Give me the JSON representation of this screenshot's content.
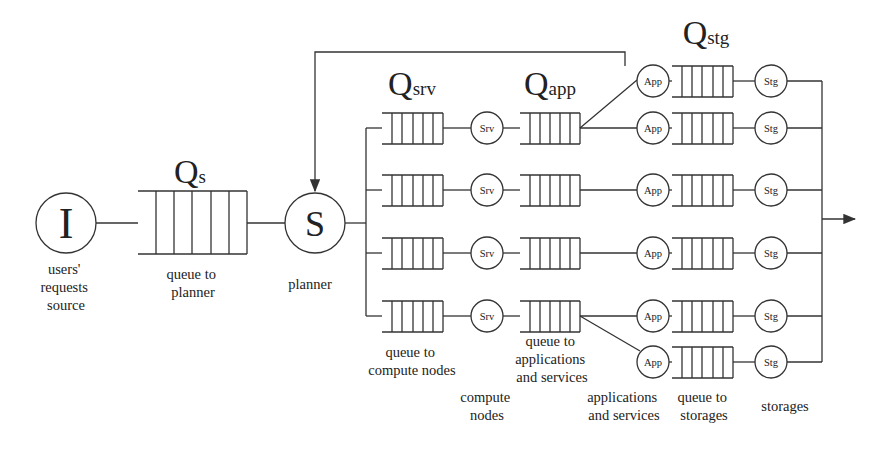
{
  "diagram": {
    "type": "queueing-network",
    "source": {
      "symbol": "I",
      "caption_lines": [
        "users'",
        "requests",
        "source"
      ]
    },
    "planner_queue": {
      "label_main": "Q",
      "label_sub": "s",
      "caption_lines": [
        "queue to",
        "planner"
      ]
    },
    "planner": {
      "symbol": "S",
      "caption": "planner"
    },
    "server_queues": {
      "label_main": "Q",
      "label_sub": "srv",
      "caption_lines": [
        "queue to",
        "compute nodes"
      ],
      "count": 4
    },
    "compute_nodes": {
      "node_label": "Srv",
      "caption_lines": [
        "compute",
        "nodes"
      ],
      "count": 4
    },
    "app_queues": {
      "label_main": "Q",
      "label_sub": "app",
      "caption_lines": [
        "queue to",
        "applications",
        "and services"
      ],
      "count": 4
    },
    "apps": {
      "node_label": "App",
      "caption_lines": [
        "applications",
        "and services"
      ],
      "count": 6
    },
    "storage_queues": {
      "label_main": "Q",
      "label_sub": "stg",
      "caption_lines": [
        "queue to",
        "storages"
      ],
      "count": 6
    },
    "storages": {
      "node_label": "Stg",
      "caption": "storages",
      "count": 6
    },
    "feedback": "App (top) -> planner S",
    "output": "arrow to right"
  }
}
